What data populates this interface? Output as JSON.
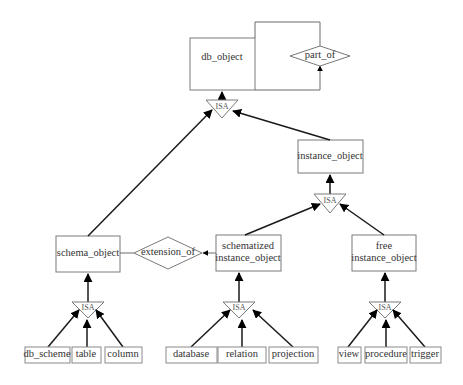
{
  "diagram": {
    "type": "ER generalization hierarchy",
    "nodes": {
      "db_object": "db_object",
      "part_of": "part_of",
      "instance_object": "instance_object",
      "schema_object": "schema_object",
      "extension_of": "extension_of",
      "schematized_line1": "schematized",
      "schematized_line2": "instance_object",
      "free_line1": "free",
      "free_line2": "instance_object",
      "db_scheme": "db_scheme",
      "table": "table",
      "column": "column",
      "database": "database",
      "relation": "relation",
      "projection": "projection",
      "view": "view",
      "procedure": "procedure",
      "trigger": "trigger"
    },
    "isa_label": "ISA",
    "relationships": [
      {
        "type": "ISA",
        "parent": "db_object",
        "children": [
          "schema_object",
          "instance_object"
        ]
      },
      {
        "type": "ISA",
        "parent": "instance_object",
        "children": [
          "schematized instance_object",
          "free instance_object"
        ]
      },
      {
        "type": "ISA",
        "parent": "schema_object",
        "children": [
          "db_scheme",
          "table",
          "column"
        ]
      },
      {
        "type": "ISA",
        "parent": "schematized instance_object",
        "children": [
          "database",
          "relation",
          "projection"
        ]
      },
      {
        "type": "ISA",
        "parent": "free instance_object",
        "children": [
          "view",
          "procedure",
          "trigger"
        ]
      },
      {
        "type": "relationship",
        "name": "part_of",
        "between": [
          "db_object",
          "db_object"
        ]
      },
      {
        "type": "relationship",
        "name": "extension_of",
        "between": [
          "schematized instance_object",
          "schema_object"
        ]
      }
    ]
  }
}
